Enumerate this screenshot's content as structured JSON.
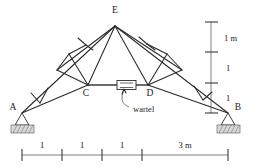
{
  "diagram": {
    "type": "truss-structural-diagram",
    "nodes": [
      {
        "id": "A",
        "label": "A",
        "x": 22,
        "y": 113,
        "kind": "support-pin-left"
      },
      {
        "id": "B",
        "label": "B",
        "x": 228,
        "y": 113,
        "kind": "support-pin-right"
      },
      {
        "id": "C",
        "label": "C",
        "x": 88,
        "y": 85,
        "kind": "joint"
      },
      {
        "id": "D",
        "label": "D",
        "x": 148,
        "y": 85,
        "kind": "joint"
      },
      {
        "id": "E",
        "label": "E",
        "x": 115,
        "y": 26,
        "kind": "apex"
      }
    ],
    "annotations": [
      {
        "id": "wartel",
        "label": "wartel",
        "x": 136,
        "y": 111
      }
    ],
    "vertical_dimensions": {
      "axis_x": 211,
      "labels": [
        "1 m",
        "1",
        "1"
      ],
      "ticks_y": [
        22,
        52,
        83,
        113
      ],
      "label_x": 222,
      "label_y": [
        40,
        70,
        100
      ]
    },
    "horizontal_dimensions": {
      "axis_y": 155,
      "labels": [
        "1",
        "1",
        "1",
        "3 m"
      ],
      "ticks_x": [
        22,
        62,
        102,
        142,
        228
      ],
      "label_y": 147,
      "label_x": [
        42,
        82,
        122,
        185
      ]
    },
    "colors": {
      "member": "#2a2a2a",
      "chord": "#3a3a3a",
      "dimension": "#4a4a4a",
      "support_fill": "#d9d9d9",
      "background": "#ffffff"
    }
  }
}
